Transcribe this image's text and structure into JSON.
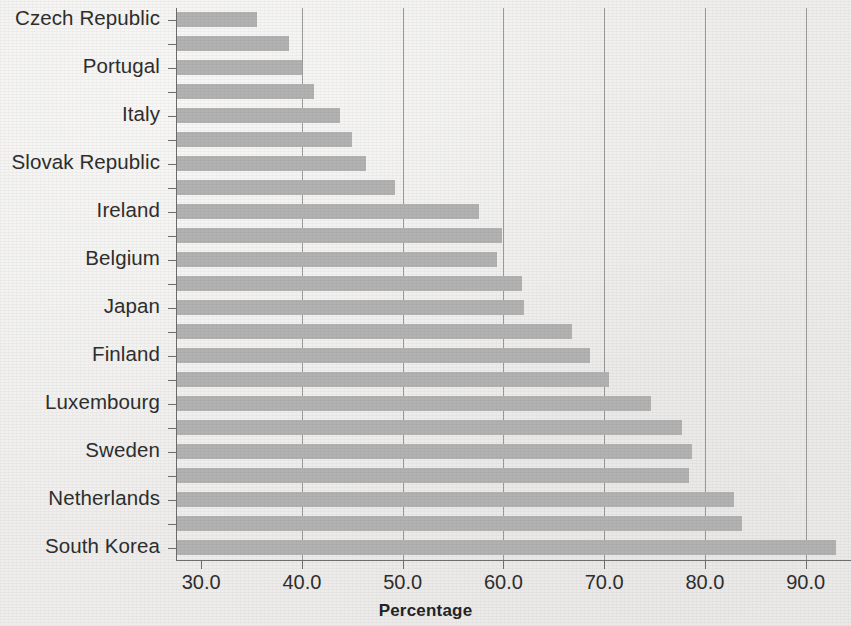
{
  "chart_data": {
    "type": "bar",
    "orientation": "horizontal",
    "title": "",
    "xlabel": "Percentage",
    "ylabel": "",
    "xlim": [
      27.5,
      94.5
    ],
    "xticks": [
      "30.0",
      "40.0",
      "50.0",
      "60.0",
      "70.0",
      "80.0",
      "90.0"
    ],
    "xtick_values": [
      30,
      40,
      50,
      60,
      70,
      80,
      90
    ],
    "grid": "vertical",
    "legend": "none",
    "bar_color": "#b2b2b2",
    "background_color": "#efeeec",
    "axis_color": "#6e6e6e",
    "text_color": "#2e2e2e",
    "note": "Only every other category carries a visible tick label in the source figure.",
    "categories": [
      "Czech Republic",
      "",
      "Portugal",
      "",
      "Italy",
      "",
      "Slovak Republic",
      "",
      "Ireland",
      "",
      "Belgium",
      "",
      "Japan",
      "",
      "Finland",
      "",
      "Luxembourg",
      "",
      "Sweden",
      "",
      "Netherlands",
      "",
      "South Korea"
    ],
    "labelled_categories": [
      "Czech Republic",
      "Portugal",
      "Italy",
      "Slovak Republic",
      "Ireland",
      "Belgium",
      "Japan",
      "Finland",
      "Luxembourg",
      "Sweden",
      "Netherlands",
      "South Korea"
    ],
    "values": [
      35.5,
      38.7,
      40.0,
      41.2,
      43.8,
      45.0,
      46.4,
      49.2,
      57.6,
      59.9,
      59.4,
      61.8,
      62.0,
      66.8,
      68.6,
      70.5,
      74.6,
      77.7,
      78.7,
      78.4,
      82.9,
      83.7,
      93.0
    ]
  }
}
